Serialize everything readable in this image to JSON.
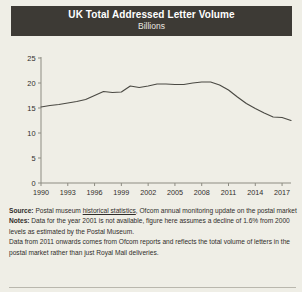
{
  "header": {
    "title": "UK Total Addressed Letter Volume",
    "subtitle": "Billions"
  },
  "colors": {
    "title_bar_bg": "#3d3a35",
    "title_text": "#ffffff",
    "page_bg": "#efeee6",
    "line": "#4a4943",
    "axis": "#8d8c82",
    "text": "#2f2d2a"
  },
  "footnotes": {
    "source_label": "Source:",
    "source_text_a": " Postal museum ",
    "source_link": "historical statistics",
    "source_text_b": ", Ofcom annual monitoring update on the postal market",
    "notes_label": "Notes:",
    "notes_text": " Data for the year 2001 is not available, figure here assumes a decline of 1.6% from 2000 levels as estimated by the Postal Museum.",
    "notes_text_2": "Data from 2011 onwards comes from Ofcom reports and reflects the total volume of letters in the postal market rather than just Royal Mail deliveries."
  },
  "chart_data": {
    "type": "line",
    "title": "UK Total Addressed Letter Volume",
    "subtitle": "Billions",
    "xlabel": "",
    "ylabel": "Billions",
    "ylim": [
      0,
      25
    ],
    "xlim": [
      1990,
      2018
    ],
    "yticks": [
      0,
      5,
      10,
      15,
      20,
      25
    ],
    "xticks": [
      1990,
      1993,
      1996,
      1999,
      2002,
      2005,
      2008,
      2011,
      2014,
      2017
    ],
    "grid": false,
    "legend": "none",
    "series": [
      {
        "name": "UK total addressed letter volume",
        "x": [
          1990,
          1991,
          1992,
          1993,
          1994,
          1995,
          1996,
          1997,
          1998,
          1999,
          2000,
          2001,
          2002,
          2003,
          2004,
          2005,
          2006,
          2007,
          2008,
          2009,
          2010,
          2011,
          2012,
          2013,
          2014,
          2015,
          2016,
          2017,
          2018
        ],
        "values": [
          15.2,
          15.5,
          15.7,
          16.0,
          16.3,
          16.7,
          17.5,
          18.3,
          18.1,
          18.2,
          19.4,
          19.1,
          19.4,
          19.8,
          19.8,
          19.7,
          19.7,
          20.0,
          20.2,
          20.2,
          19.6,
          18.6,
          17.2,
          15.9,
          14.9,
          14.0,
          13.2,
          13.1,
          12.5
        ]
      }
    ],
    "notes": [
      "Data for the year 2001 is not available, figure here assumes a decline of 1.6% from 2000 levels as estimated by the Postal Museum.",
      "Data from 2011 onwards comes from Ofcom reports and reflects the total volume of letters in the postal market rather than just Royal Mail deliveries."
    ]
  }
}
